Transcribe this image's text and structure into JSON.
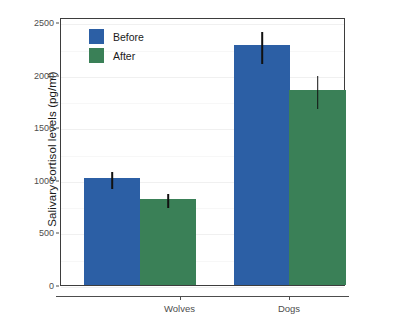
{
  "chart_data": {
    "type": "bar",
    "title": "",
    "xlabel": "",
    "ylabel": "Salivary cortisol levels  (pg/ml)",
    "categories": [
      "Wolves",
      "Dogs"
    ],
    "ylim": [
      0,
      2550
    ],
    "yticks": [
      0,
      500,
      1000,
      1500,
      2000,
      2500
    ],
    "ytick_labels": [
      "0",
      "500",
      "1000",
      "1500",
      "2000",
      "2500"
    ],
    "grid": true,
    "legend_position": "top-left",
    "series": [
      {
        "name": "Before",
        "color": "#2c5fa5",
        "values": [
          1020,
          2280
        ],
        "error_low": [
          930,
          2120
        ],
        "error_high": [
          1090,
          2425
        ]
      },
      {
        "name": "After",
        "color": "#3a8057",
        "values": [
          820,
          1855
        ],
        "error_low": [
          750,
          1690
        ],
        "error_high": [
          885,
          2010
        ]
      }
    ]
  },
  "legend": {
    "entries": [
      {
        "label": "Before",
        "color": "#2c5fa5"
      },
      {
        "label": "After",
        "color": "#3a8057"
      }
    ]
  }
}
